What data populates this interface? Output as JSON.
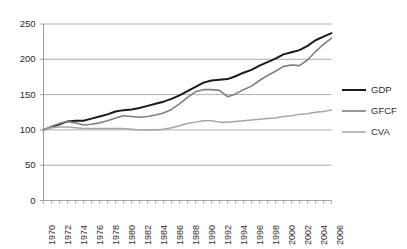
{
  "chart_data": {
    "type": "line",
    "title": "",
    "subtitle": "",
    "xlabel": "",
    "ylabel": "",
    "xlim": [
      1970,
      2006
    ],
    "ylim": [
      0,
      250
    ],
    "yticks": [
      0,
      50,
      100,
      150,
      200,
      250
    ],
    "grid": true,
    "grid_axis": "y",
    "legend_position": "right",
    "x": [
      1970,
      1971,
      1972,
      1973,
      1974,
      1975,
      1976,
      1977,
      1978,
      1979,
      1980,
      1981,
      1982,
      1983,
      1984,
      1985,
      1986,
      1987,
      1988,
      1989,
      1990,
      1991,
      1992,
      1993,
      1994,
      1995,
      1996,
      1997,
      1998,
      1999,
      2000,
      2001,
      2002,
      2003,
      2004,
      2005,
      2006
    ],
    "xticks": [
      1970,
      1972,
      1974,
      1976,
      1978,
      1980,
      1982,
      1984,
      1986,
      1988,
      1990,
      1992,
      1994,
      1996,
      1998,
      2000,
      2002,
      2004,
      2006
    ],
    "xtick_labels": [
      "1970",
      "1972",
      "1974",
      "1976",
      "1978",
      "1980",
      "1982",
      "1984",
      "1986",
      "1988",
      "1990",
      "1992",
      "1994",
      "1996",
      "1998",
      "2000",
      "2002",
      "2004",
      "2006"
    ],
    "ytick_labels": [
      "0",
      "50",
      "100",
      "150",
      "200",
      "250"
    ],
    "series": [
      {
        "name": "GDP",
        "color": "#1a1a1a",
        "values": [
          100,
          104,
          108,
          112,
          113,
          113,
          116,
          119,
          122,
          126,
          128,
          129,
          131,
          134,
          137,
          140,
          144,
          149,
          155,
          161,
          167,
          170,
          171,
          172,
          176,
          181,
          185,
          191,
          196,
          201,
          207,
          210,
          213,
          219,
          227,
          232,
          237
        ]
      },
      {
        "name": "GFCF",
        "color": "#7f7f7f",
        "values": [
          100,
          105,
          109,
          112,
          110,
          107,
          108,
          110,
          113,
          117,
          120,
          119,
          118,
          119,
          121,
          124,
          129,
          137,
          146,
          154,
          157,
          157,
          156,
          147,
          151,
          157,
          162,
          170,
          177,
          183,
          190,
          192,
          191,
          199,
          211,
          221,
          230
        ]
      },
      {
        "name": "CVA",
        "color": "#a6a6a6",
        "values": [
          100,
          103,
          104,
          104,
          103,
          102,
          102,
          102,
          102,
          102,
          102,
          101,
          100,
          100,
          100,
          101,
          103,
          106,
          109,
          111,
          113,
          113,
          111,
          111,
          112,
          113,
          114,
          115,
          116,
          117,
          119,
          120,
          122,
          123,
          125,
          126,
          128
        ]
      }
    ]
  },
  "legend": {
    "items": [
      {
        "label": "GDP"
      },
      {
        "label": "GFCF"
      },
      {
        "label": "CVA"
      }
    ]
  },
  "axes": {
    "y_axis_name": "value-axis",
    "x_axis_name": "year-axis"
  }
}
